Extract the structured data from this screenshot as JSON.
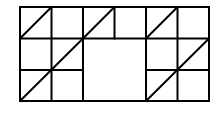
{
  "diagram": {
    "title": "",
    "grid": {
      "columns": 6,
      "rows": 3,
      "origin": [
        20,
        7
      ],
      "cell_size": 31.5,
      "stroke_color": "#000000",
      "stroke_width": 2
    },
    "lines": [
      {
        "x1": 20,
        "y1": 7,
        "x2": 209,
        "y2": 7
      },
      {
        "x1": 20,
        "y1": 38.5,
        "x2": 83,
        "y2": 38.5
      },
      {
        "x1": 146,
        "y1": 38.5,
        "x2": 209,
        "y2": 38.5
      },
      {
        "x1": 83,
        "y1": 38.5,
        "x2": 146,
        "y2": 38.5
      },
      {
        "x1": 20,
        "y1": 70,
        "x2": 83,
        "y2": 70
      },
      {
        "x1": 146,
        "y1": 70,
        "x2": 209,
        "y2": 70
      },
      {
        "x1": 20,
        "y1": 101,
        "x2": 209,
        "y2": 101
      },
      {
        "x1": 20,
        "y1": 7,
        "x2": 20,
        "y2": 101
      },
      {
        "x1": 51.5,
        "y1": 7,
        "x2": 51.5,
        "y2": 101
      },
      {
        "x1": 83,
        "y1": 7,
        "x2": 83,
        "y2": 101
      },
      {
        "x1": 114.5,
        "y1": 7,
        "x2": 114.5,
        "y2": 38.5
      },
      {
        "x1": 146,
        "y1": 7,
        "x2": 146,
        "y2": 101
      },
      {
        "x1": 177.5,
        "y1": 7,
        "x2": 177.5,
        "y2": 101
      },
      {
        "x1": 209,
        "y1": 7,
        "x2": 209,
        "y2": 101
      }
    ],
    "diagonals": [
      {
        "x1": 20,
        "y1": 38.5,
        "x2": 51.5,
        "y2": 7
      },
      {
        "x1": 83,
        "y1": 38.5,
        "x2": 114.5,
        "y2": 7
      },
      {
        "x1": 146,
        "y1": 38.5,
        "x2": 177.5,
        "y2": 7
      },
      {
        "x1": 20,
        "y1": 101,
        "x2": 83,
        "y2": 38.5
      },
      {
        "x1": 146,
        "y1": 101,
        "x2": 209,
        "y2": 38.5
      }
    ],
    "merged_cell": {
      "x": 83,
      "y": 38.5,
      "width": 63,
      "height": 62.5
    }
  }
}
